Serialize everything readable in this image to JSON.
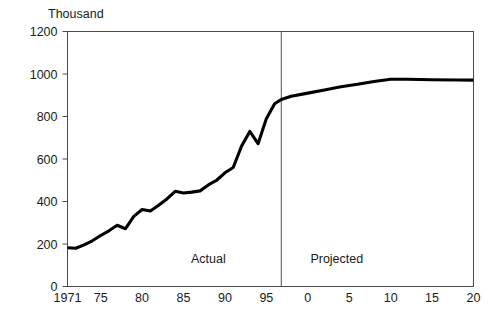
{
  "chart_data": {
    "type": "line",
    "title": "",
    "subtitle": "",
    "unit_label": "Thousand",
    "xlabel": "",
    "ylabel": "",
    "ylim": [
      0,
      1200
    ],
    "xlim": [
      1971,
      2020
    ],
    "grid": false,
    "legend": "none",
    "y_ticks": [
      0,
      200,
      400,
      600,
      800,
      1000,
      1200
    ],
    "y_tick_labels": [
      "0",
      "200",
      "400",
      "600",
      "800",
      "1000",
      "1200"
    ],
    "x_ticks": [
      1971,
      1975,
      1980,
      1985,
      1990,
      1995,
      2000,
      2005,
      2010,
      2015,
      2020
    ],
    "x_tick_labels": [
      "1971",
      "75",
      "80",
      "85",
      "90",
      "95",
      "0",
      "5",
      "10",
      "15",
      "20"
    ],
    "annotations": [
      {
        "name": "actual-label",
        "text": "Actual",
        "x": 1988.0,
        "y": 110
      },
      {
        "name": "projected-label",
        "text": "Projected",
        "x": 2003.5,
        "y": 110
      }
    ],
    "divider_x": 1996.8,
    "series": [
      {
        "name": "Value",
        "color": "#000000",
        "x": [
          1971,
          1972,
          1973,
          1974,
          1975,
          1976,
          1977,
          1978,
          1979,
          1980,
          1981,
          1982,
          1983,
          1984,
          1985,
          1986,
          1987,
          1988,
          1989,
          1990,
          1991,
          1992,
          1993,
          1994,
          1995,
          1996,
          1996.8,
          1998,
          2000,
          2002,
          2004,
          2006,
          2008,
          2010,
          2012,
          2015,
          2018,
          2020
        ],
        "values": [
          182,
          180,
          196,
          215,
          240,
          262,
          288,
          272,
          330,
          362,
          355,
          382,
          412,
          448,
          440,
          444,
          450,
          478,
          500,
          535,
          560,
          660,
          730,
          672,
          790,
          860,
          880,
          895,
          910,
          925,
          940,
          952,
          965,
          975,
          975,
          973,
          972,
          971
        ]
      }
    ]
  }
}
